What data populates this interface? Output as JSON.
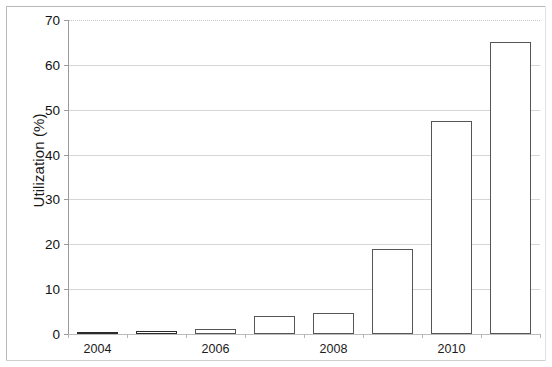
{
  "chart_data": {
    "type": "bar",
    "title": "",
    "subtitle": "",
    "xlabel": "",
    "ylabel": "Utilization (%)",
    "categories": [
      "2004",
      "2005",
      "2006",
      "2007",
      "2008",
      "2009",
      "2010",
      "2011"
    ],
    "values": [
      0.3,
      0.6,
      1.1,
      4.0,
      4.7,
      19.0,
      47.4,
      65.0
    ],
    "series": [
      {
        "name": "Utilization",
        "values": [
          0.3,
          0.6,
          1.1,
          4.0,
          4.7,
          19.0,
          47.4,
          65.0
        ]
      }
    ],
    "ylim": [
      0,
      70
    ],
    "yticks": [
      0,
      10,
      20,
      30,
      40,
      50,
      60,
      70
    ],
    "ytick_labels": [
      "0",
      "10",
      "20",
      "30",
      "40",
      "50",
      "60",
      "70"
    ],
    "xtick_labels": [
      "2004",
      "2006",
      "2008",
      "2010"
    ],
    "xtick_category_indices": [
      0,
      2,
      4,
      6
    ],
    "grid": true,
    "grid_axis": "y",
    "legend": false,
    "legend_position": "none",
    "bar_fill_color": "#ffffff",
    "bar_edge_color": "#555555",
    "gridline_color": "#d6d6d6",
    "axis_color": "#9a9a9a",
    "text_color": "#111111"
  }
}
